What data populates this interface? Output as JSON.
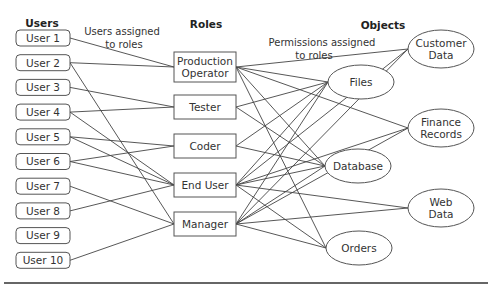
{
  "headings": {
    "users": "Users",
    "roles": "Roles",
    "objects": "Objects"
  },
  "annotations": {
    "users_to_roles": [
      "Users assigned",
      "to roles"
    ],
    "permissions_to_roles": [
      "Permissions assigned",
      "to roles"
    ]
  },
  "users": [
    {
      "id": "u1",
      "label": "User 1"
    },
    {
      "id": "u2",
      "label": "User 2"
    },
    {
      "id": "u3",
      "label": "User 3"
    },
    {
      "id": "u4",
      "label": "User 4"
    },
    {
      "id": "u5",
      "label": "User 5"
    },
    {
      "id": "u6",
      "label": "User 6"
    },
    {
      "id": "u7",
      "label": "User 7"
    },
    {
      "id": "u8",
      "label": "User 8"
    },
    {
      "id": "u9",
      "label": "User 9"
    },
    {
      "id": "u10",
      "label": "User 10"
    }
  ],
  "roles": [
    {
      "id": "prod",
      "label": [
        "Production",
        "Operator"
      ]
    },
    {
      "id": "tester",
      "label": [
        "Tester"
      ]
    },
    {
      "id": "coder",
      "label": [
        "Coder"
      ]
    },
    {
      "id": "enduser",
      "label": [
        "End User"
      ]
    },
    {
      "id": "manager",
      "label": [
        "Manager"
      ]
    }
  ],
  "objects": [
    {
      "id": "customer",
      "label": [
        "Customer",
        "Data"
      ]
    },
    {
      "id": "files",
      "label": [
        "Files"
      ]
    },
    {
      "id": "finance",
      "label": [
        "Finance",
        "Records"
      ]
    },
    {
      "id": "database",
      "label": [
        "Database"
      ]
    },
    {
      "id": "web",
      "label": [
        "Web",
        "Data"
      ]
    },
    {
      "id": "orders",
      "label": [
        "Orders"
      ]
    }
  ],
  "user_role_edges": [
    [
      "u1",
      "prod"
    ],
    [
      "u2",
      "prod"
    ],
    [
      "u2",
      "manager"
    ],
    [
      "u3",
      "tester"
    ],
    [
      "u4",
      "tester"
    ],
    [
      "u4",
      "enduser"
    ],
    [
      "u5",
      "coder"
    ],
    [
      "u5",
      "enduser"
    ],
    [
      "u6",
      "coder"
    ],
    [
      "u6",
      "enduser"
    ],
    [
      "u7",
      "manager"
    ],
    [
      "u8",
      "enduser"
    ],
    [
      "u10",
      "manager"
    ]
  ],
  "role_object_edges": [
    [
      "prod",
      "customer"
    ],
    [
      "prod",
      "files"
    ],
    [
      "prod",
      "finance"
    ],
    [
      "prod",
      "database"
    ],
    [
      "prod",
      "orders"
    ],
    [
      "tester",
      "files"
    ],
    [
      "tester",
      "database"
    ],
    [
      "coder",
      "files"
    ],
    [
      "coder",
      "database"
    ],
    [
      "enduser",
      "customer"
    ],
    [
      "enduser",
      "files"
    ],
    [
      "enduser",
      "finance"
    ],
    [
      "enduser",
      "database"
    ],
    [
      "enduser",
      "web"
    ],
    [
      "enduser",
      "orders"
    ],
    [
      "manager",
      "customer"
    ],
    [
      "manager",
      "files"
    ],
    [
      "manager",
      "finance"
    ],
    [
      "manager",
      "database"
    ],
    [
      "manager",
      "web"
    ],
    [
      "manager",
      "orders"
    ]
  ]
}
